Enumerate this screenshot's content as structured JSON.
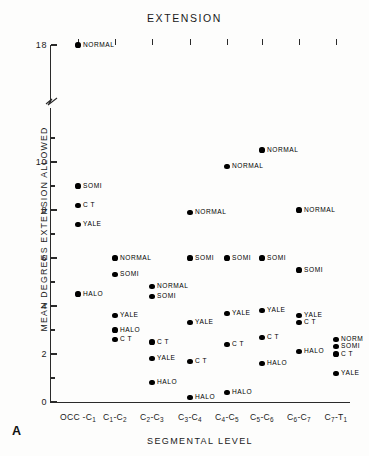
{
  "chart_data": {
    "type": "scatter",
    "title": "EXTENSION",
    "xlabel": "SEGMENTAL LEVEL",
    "ylabel": "MEAN DEGREES EXTENSION ALLOWED",
    "panel_label": "A",
    "grid": false,
    "legend": "none (points labeled inline)",
    "axis_break": {
      "present": true,
      "between": [
        11,
        17
      ]
    },
    "ylim": [
      0,
      18
    ],
    "yticks_major": [
      0,
      2,
      4,
      6,
      8,
      10,
      18
    ],
    "yticks_minor": [
      1,
      3,
      5,
      7,
      9,
      11
    ],
    "categories": [
      "OCC-C1",
      "C1-C2",
      "C2-C3",
      "C3-C4",
      "C4-C5",
      "C5-C6",
      "C6-C7",
      "C7-T1"
    ],
    "category_labels": [
      {
        "main": "OCC -C",
        "sub": "1"
      },
      {
        "main": "C",
        "sub": "1",
        "main2": "-C",
        "sub2": "2"
      },
      {
        "main": "C",
        "sub": "2",
        "main2": "-C",
        "sub2": "3"
      },
      {
        "main": "C",
        "sub": "3",
        "main2": "-C",
        "sub2": "4"
      },
      {
        "main": "C",
        "sub": "4",
        "main2": "-C",
        "sub2": "5"
      },
      {
        "main": "C",
        "sub": "5",
        "main2": "-C",
        "sub2": "6"
      },
      {
        "main": "C",
        "sub": "6",
        "main2": "-C",
        "sub2": "7"
      },
      {
        "main": "C",
        "sub": "7",
        "main2": "-T",
        "sub2": "1"
      }
    ],
    "series": [
      {
        "name": "NORMAL",
        "values": [
          18.0,
          6.0,
          4.8,
          7.9,
          9.8,
          10.5,
          8.0,
          2.6
        ]
      },
      {
        "name": "SOMI",
        "values": [
          9.0,
          5.3,
          4.4,
          6.0,
          6.0,
          6.0,
          5.5,
          2.3
        ]
      },
      {
        "name": "C T",
        "values": [
          8.2,
          2.6,
          2.5,
          1.7,
          2.4,
          2.7,
          3.3,
          2.0
        ]
      },
      {
        "name": "YALE",
        "values": [
          7.4,
          3.6,
          1.8,
          3.3,
          3.7,
          3.8,
          3.6,
          1.2
        ]
      },
      {
        "name": "HALO",
        "values": [
          4.5,
          3.0,
          0.8,
          0.2,
          0.4,
          1.6,
          2.1,
          null
        ]
      }
    ],
    "points": [
      {
        "col": 0,
        "value": 18.0,
        "label": "NORMAL"
      },
      {
        "col": 0,
        "value": 9.0,
        "label": "SOMI"
      },
      {
        "col": 0,
        "value": 8.2,
        "label": "C T"
      },
      {
        "col": 0,
        "value": 7.4,
        "label": "YALE"
      },
      {
        "col": 0,
        "value": 4.5,
        "label": "HALO"
      },
      {
        "col": 1,
        "value": 6.0,
        "label": "NORMAL"
      },
      {
        "col": 1,
        "value": 5.3,
        "label": "SOMI"
      },
      {
        "col": 1,
        "value": 3.6,
        "label": "YALE"
      },
      {
        "col": 1,
        "value": 3.0,
        "label": "HALO"
      },
      {
        "col": 1,
        "value": 2.6,
        "label": "C T"
      },
      {
        "col": 2,
        "value": 4.8,
        "label": "NORMAL"
      },
      {
        "col": 2,
        "value": 4.4,
        "label": "SOMI"
      },
      {
        "col": 2,
        "value": 2.5,
        "label": "C T"
      },
      {
        "col": 2,
        "value": 1.8,
        "label": "YALE"
      },
      {
        "col": 2,
        "value": 0.8,
        "label": "HALO"
      },
      {
        "col": 3,
        "value": 7.9,
        "label": "NORMAL"
      },
      {
        "col": 3,
        "value": 6.0,
        "label": "SOMI"
      },
      {
        "col": 3,
        "value": 3.3,
        "label": "YALE"
      },
      {
        "col": 3,
        "value": 1.7,
        "label": "C T"
      },
      {
        "col": 3,
        "value": 0.2,
        "label": "HALO"
      },
      {
        "col": 4,
        "value": 9.8,
        "label": "NORMAL"
      },
      {
        "col": 4,
        "value": 6.0,
        "label": "SOMI"
      },
      {
        "col": 4,
        "value": 3.7,
        "label": "YALE"
      },
      {
        "col": 4,
        "value": 2.4,
        "label": "C T"
      },
      {
        "col": 4,
        "value": 0.4,
        "label": "HALO"
      },
      {
        "col": 5,
        "value": 10.5,
        "label": "NORMAL"
      },
      {
        "col": 5,
        "value": 6.0,
        "label": "SOMI"
      },
      {
        "col": 5,
        "value": 3.8,
        "label": "YALE"
      },
      {
        "col": 5,
        "value": 2.7,
        "label": "C T"
      },
      {
        "col": 5,
        "value": 1.6,
        "label": "HALO"
      },
      {
        "col": 6,
        "value": 8.0,
        "label": "NORMAL"
      },
      {
        "col": 6,
        "value": 5.5,
        "label": "SOMI"
      },
      {
        "col": 6,
        "value": 3.6,
        "label": "YALE"
      },
      {
        "col": 6,
        "value": 3.3,
        "label": "C T"
      },
      {
        "col": 6,
        "value": 2.1,
        "label": "HALO"
      },
      {
        "col": 7,
        "value": 2.6,
        "label": "NORM"
      },
      {
        "col": 7,
        "value": 2.3,
        "label": "SOMI"
      },
      {
        "col": 7,
        "value": 2.0,
        "label": "C T"
      },
      {
        "col": 7,
        "value": 1.2,
        "label": "YALE"
      }
    ]
  }
}
